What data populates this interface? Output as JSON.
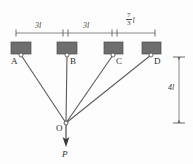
{
  "figure": {
    "colors": {
      "block_fill": "#6e6e6e",
      "block_stroke": "#4a4a4a",
      "line": "#5a5a5a",
      "dim_line": "#6a6a6a",
      "text": "#2e2e2e",
      "background": "#fdfdfd"
    },
    "supports": [
      {
        "id": "A",
        "label": "A",
        "x": 21,
        "y": 57
      },
      {
        "id": "B",
        "label": "B",
        "x": 68,
        "y": 57
      },
      {
        "id": "C",
        "label": "C",
        "x": 114,
        "y": 57
      },
      {
        "id": "D",
        "label": "D",
        "x": 152,
        "y": 57
      }
    ],
    "junction": {
      "id": "O",
      "label": "O",
      "x": 66,
      "y": 123
    },
    "force": {
      "label": "P",
      "direction": "down",
      "tip_x": 66,
      "tip_y": 146
    },
    "horizontal_dimensions": [
      {
        "id": "A-B",
        "label": "3l",
        "numerator": null,
        "denominator": null,
        "unit": null,
        "from_x": 16,
        "to_x": 66
      },
      {
        "id": "B-C",
        "label": "3l",
        "numerator": null,
        "denominator": null,
        "unit": null,
        "from_x": 66,
        "to_x": 115
      },
      {
        "id": "C-D",
        "label": null,
        "numerator": "7",
        "denominator": "3",
        "unit": "l",
        "from_x": 115,
        "to_x": 155
      }
    ],
    "vertical_dimension": {
      "id": "D-O",
      "label": "4l",
      "from_y": 57,
      "to_y": 123,
      "x": 179
    }
  }
}
